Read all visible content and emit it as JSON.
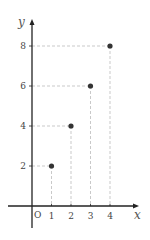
{
  "chart_data": {
    "type": "scatter",
    "title": "",
    "xlabel": "x",
    "ylabel": "y",
    "origin_label": "O",
    "x_ticks": [
      1,
      2,
      3,
      4
    ],
    "y_ticks": [
      2,
      4,
      6,
      8
    ],
    "x": [
      1,
      2,
      3,
      4
    ],
    "y": [
      2,
      4,
      6,
      8
    ],
    "points": [
      {
        "x": 1,
        "y": 2
      },
      {
        "x": 2,
        "y": 4
      },
      {
        "x": 3,
        "y": 6
      },
      {
        "x": 4,
        "y": 8
      }
    ],
    "xlim": [
      -0.5,
      5
    ],
    "ylim": [
      -1,
      9
    ],
    "grid": false,
    "dashed_guides": true,
    "legend": null
  },
  "colors": {
    "axis": "#222222",
    "point": "#333333",
    "guide": "#bbbbbb"
  }
}
